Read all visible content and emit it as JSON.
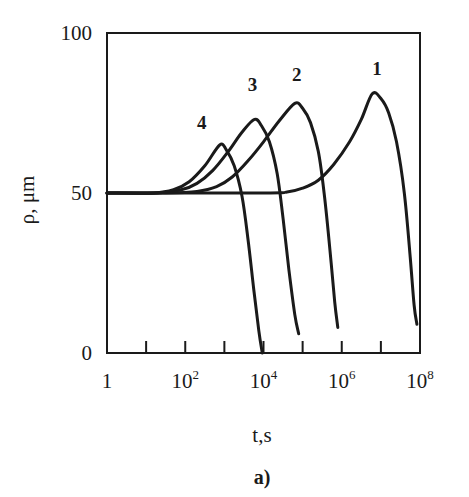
{
  "chart_data": {
    "type": "line",
    "title": "",
    "caption": "a)",
    "xlabel": "t,s",
    "ylabel": "ρ, μm",
    "xscale": "log",
    "xlim": [
      1,
      100000000
    ],
    "ylim": [
      0,
      100
    ],
    "x_ticks": [
      1,
      10,
      100,
      1000,
      10000,
      100000,
      1000000,
      10000000,
      100000000
    ],
    "x_tick_labels": [
      {
        "base": "1",
        "exp": ""
      },
      {
        "base": "10",
        "exp": "2"
      },
      {
        "base": "10",
        "exp": "4"
      },
      {
        "base": "10",
        "exp": "6"
      },
      {
        "base": "10",
        "exp": "8"
      }
    ],
    "x_tick_label_values": [
      1,
      100,
      10000,
      1000000,
      100000000
    ],
    "y_ticks": [
      0,
      50,
      100
    ],
    "y_tick_labels": [
      "0",
      "50",
      "100"
    ],
    "grid": false,
    "legend": "inline curve numbers",
    "series": [
      {
        "name": "1",
        "label_pos_log10x": 6.9,
        "label_pos_y": 87,
        "points": [
          [
            0,
            50
          ],
          [
            4.0,
            50
          ],
          [
            4.6,
            50.3
          ],
          [
            5.0,
            51.5
          ],
          [
            5.4,
            54
          ],
          [
            5.8,
            59
          ],
          [
            6.2,
            66
          ],
          [
            6.5,
            73
          ],
          [
            6.78,
            81
          ],
          [
            7.0,
            79.5
          ],
          [
            7.2,
            75
          ],
          [
            7.4,
            66
          ],
          [
            7.6,
            50
          ],
          [
            7.75,
            30
          ],
          [
            7.85,
            15
          ],
          [
            7.92,
            9
          ]
        ]
      },
      {
        "name": "2",
        "label_pos_log10x": 4.85,
        "label_pos_y": 85,
        "points": [
          [
            0,
            50
          ],
          [
            1.5,
            50
          ],
          [
            2.3,
            50.5
          ],
          [
            2.8,
            52
          ],
          [
            3.2,
            55
          ],
          [
            3.6,
            60
          ],
          [
            4.0,
            66
          ],
          [
            4.4,
            72.5
          ],
          [
            4.8,
            78
          ],
          [
            5.0,
            76.5
          ],
          [
            5.2,
            72
          ],
          [
            5.4,
            63
          ],
          [
            5.55,
            50
          ],
          [
            5.7,
            32
          ],
          [
            5.82,
            16
          ],
          [
            5.9,
            8
          ]
        ]
      },
      {
        "name": "3",
        "label_pos_log10x": 3.72,
        "label_pos_y": 82,
        "points": [
          [
            0,
            50
          ],
          [
            1.3,
            50
          ],
          [
            1.9,
            51
          ],
          [
            2.3,
            53
          ],
          [
            2.7,
            57
          ],
          [
            3.1,
            63
          ],
          [
            3.45,
            69
          ],
          [
            3.77,
            73
          ],
          [
            3.95,
            71
          ],
          [
            4.15,
            66
          ],
          [
            4.35,
            56
          ],
          [
            4.5,
            42
          ],
          [
            4.65,
            26
          ],
          [
            4.8,
            12
          ],
          [
            4.9,
            6
          ]
        ]
      },
      {
        "name": "4",
        "label_pos_log10x": 2.42,
        "label_pos_y": 70,
        "points": [
          [
            0,
            50
          ],
          [
            1.2,
            50
          ],
          [
            1.7,
            51
          ],
          [
            2.1,
            53.5
          ],
          [
            2.5,
            58.5
          ],
          [
            2.88,
            65
          ],
          [
            3.05,
            63.5
          ],
          [
            3.25,
            58.5
          ],
          [
            3.45,
            49
          ],
          [
            3.6,
            36
          ],
          [
            3.75,
            20
          ],
          [
            3.88,
            7
          ],
          [
            3.97,
            0
          ]
        ]
      }
    ]
  },
  "labels": {
    "y_axis_title": "ρ, μm",
    "x_axis_title": "t,s",
    "caption": "a)"
  }
}
